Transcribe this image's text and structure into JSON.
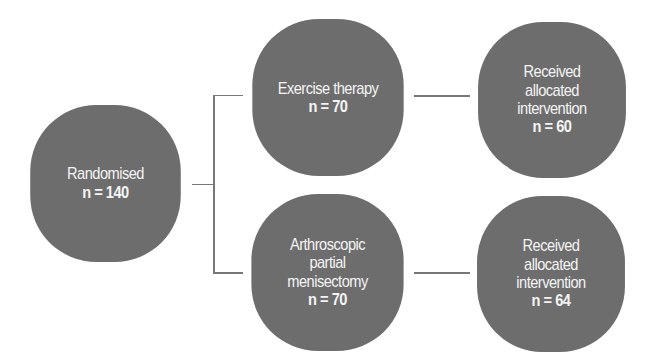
{
  "diagram": {
    "type": "flowchart",
    "nodes": {
      "randomised": {
        "label_lines": [
          "Randomised"
        ],
        "count": "n = 140"
      },
      "exercise": {
        "label_lines": [
          "Exercise therapy"
        ],
        "count": "n = 70"
      },
      "exercise_received": {
        "label_lines": [
          "Received",
          "allocated",
          "intervention"
        ],
        "count": "n = 60"
      },
      "apm": {
        "label_lines": [
          "Arthroscopic",
          "partial",
          "menisectomy"
        ],
        "count": "n = 70"
      },
      "apm_received": {
        "label_lines": [
          "Received",
          "allocated",
          "intervention"
        ],
        "count": "n = 64"
      }
    },
    "edges": [
      [
        "randomised",
        "exercise"
      ],
      [
        "randomised",
        "apm"
      ],
      [
        "exercise",
        "exercise_received"
      ],
      [
        "apm",
        "apm_received"
      ]
    ],
    "colors": {
      "node_fill": "#6d6d6d",
      "node_text": "#f4f4f4",
      "line": "#777777"
    }
  }
}
